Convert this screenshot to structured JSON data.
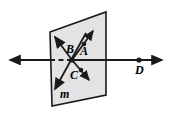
{
  "figure": {
    "type": "geometry-diagram",
    "background_color": "#ffffff",
    "plane_fill_color": "#e3e3e3",
    "stroke_color": "#1a1a1a",
    "labels": {
      "A": "A",
      "B": "B",
      "C": "C",
      "D": "D",
      "m": "m"
    },
    "plane": {
      "name": "plane",
      "shape": "parallelogram",
      "corners": [
        [
          50,
          32
        ],
        [
          106,
          12
        ],
        [
          106,
          95
        ],
        [
          52,
          106
        ]
      ]
    },
    "horizontal_line": {
      "name": "horizontal-line",
      "y": 60,
      "x_start": 6,
      "x_end": 166,
      "left_arrow": true,
      "right_arrow": true,
      "dashed_segment": {
        "x_start": 50,
        "x_end": 72
      }
    },
    "line_m": {
      "name": "line-m",
      "from": [
        85,
        34
      ],
      "to": [
        55,
        88
      ],
      "arrow_start": true,
      "arrow_end": true
    },
    "ray_upper_left": {
      "name": "ray-upper-left",
      "from": [
        72,
        60
      ],
      "to": [
        55,
        37
      ],
      "arrow_end": true
    },
    "ray_A": {
      "name": "ray-to-A",
      "from": [
        72,
        60
      ],
      "to": [
        92,
        32
      ],
      "arrow_end": true,
      "point_dot": [
        84,
        44
      ]
    },
    "ray_C": {
      "name": "ray-to-C",
      "from": [
        72,
        60
      ],
      "to": [
        88,
        79
      ],
      "arrow_end": true,
      "point_dot": [
        81,
        70
      ]
    },
    "point_B": {
      "name": "point-b",
      "at": [
        72,
        60
      ]
    },
    "point_D": {
      "name": "point-d",
      "at": [
        139,
        60
      ]
    }
  }
}
